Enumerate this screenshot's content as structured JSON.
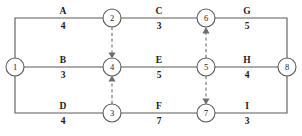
{
  "diagram": {
    "type": "activity-on-arrow-network",
    "title": "",
    "canvas": {
      "width": 302,
      "height": 136,
      "background": "#ffffff"
    },
    "colors": {
      "edge": "#5a5a5a",
      "dummy_edge": "#6e6e6e",
      "node_stroke": "#5a5a5a",
      "node_fill": "#ffffff",
      "text": "#1c1c1c"
    },
    "nodes": [
      {
        "id": "1",
        "label": "1",
        "x": 15,
        "y": 67
      },
      {
        "id": "2",
        "label": "2",
        "x": 112,
        "y": 18
      },
      {
        "id": "3",
        "label": "3",
        "x": 112,
        "y": 113
      },
      {
        "id": "4",
        "label": "4",
        "x": 112,
        "y": 67
      },
      {
        "id": "5",
        "label": "5",
        "x": 206,
        "y": 67
      },
      {
        "id": "6",
        "label": "6",
        "x": 206,
        "y": 18
      },
      {
        "id": "7",
        "label": "7",
        "x": 206,
        "y": 113
      },
      {
        "id": "8",
        "label": "8",
        "x": 287,
        "y": 67
      }
    ],
    "node_radius": 9,
    "edges": [
      {
        "name": "A",
        "duration": "4",
        "from": "1",
        "to": "2",
        "style": "solid",
        "label_x": 63,
        "label_y": 18
      },
      {
        "name": "C",
        "duration": "3",
        "from": "2",
        "to": "6",
        "style": "solid",
        "label_x": 159,
        "label_y": 18
      },
      {
        "name": "G",
        "duration": "5",
        "from": "6",
        "to": "8",
        "style": "solid",
        "label_x": 247,
        "label_y": 18
      },
      {
        "name": "B",
        "duration": "3",
        "from": "1",
        "to": "4",
        "style": "solid",
        "label_x": 63,
        "label_y": 67
      },
      {
        "name": "E",
        "duration": "5",
        "from": "4",
        "to": "5",
        "style": "solid",
        "label_x": 159,
        "label_y": 67
      },
      {
        "name": "H",
        "duration": "4",
        "from": "5",
        "to": "8",
        "style": "solid",
        "label_x": 247,
        "label_y": 67
      },
      {
        "name": "D",
        "duration": "4",
        "from": "1",
        "to": "3",
        "style": "solid",
        "label_x": 63,
        "label_y": 113
      },
      {
        "name": "F",
        "duration": "7",
        "from": "3",
        "to": "7",
        "style": "solid",
        "label_x": 159,
        "label_y": 113
      },
      {
        "name": "I",
        "duration": "3",
        "from": "7",
        "to": "8",
        "style": "solid",
        "label_x": 247,
        "label_y": 113
      }
    ],
    "dummy_edges": [
      {
        "from": "2",
        "to": "4",
        "direction": "down"
      },
      {
        "from": "3",
        "to": "4",
        "direction": "up"
      },
      {
        "from": "5",
        "to": "6",
        "direction": "up"
      },
      {
        "from": "5",
        "to": "7",
        "direction": "down"
      }
    ]
  }
}
